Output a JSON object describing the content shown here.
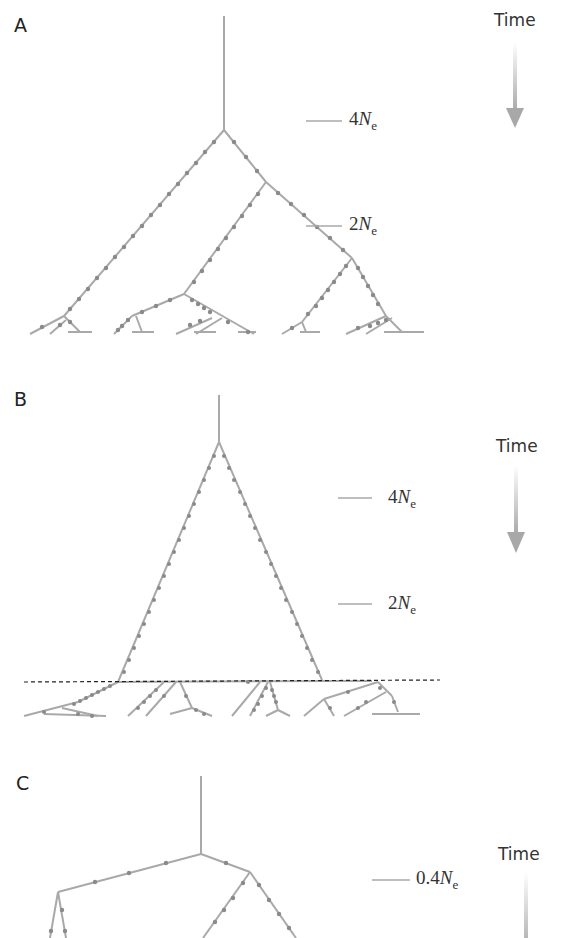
{
  "colors": {
    "branch": "#a9a9a9",
    "mutation": "#8a8a8a",
    "text": "#333333",
    "arrow": "#b0b0b0",
    "dashed_line": "#222222"
  },
  "panels": [
    {
      "label": "A",
      "time_label": "Time",
      "scale_marks": [
        {
          "prefix": "4",
          "symbol": "N",
          "subscript": "e"
        },
        {
          "prefix": "2",
          "symbol": "N",
          "subscript": "e"
        }
      ]
    },
    {
      "label": "B",
      "time_label": "Time",
      "scale_marks": [
        {
          "prefix": "4",
          "symbol": "N",
          "subscript": "e"
        },
        {
          "prefix": "2",
          "symbol": "N",
          "subscript": "e"
        }
      ]
    },
    {
      "label": "C",
      "time_label": "Time",
      "scale_marks": [
        {
          "prefix": "0.4",
          "symbol": "N",
          "subscript": "e"
        }
      ]
    }
  ]
}
